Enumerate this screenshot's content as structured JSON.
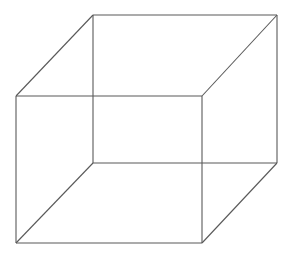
{
  "figure": {
    "background_color": "#ffffff",
    "stroke_color": "#595959",
    "stroke_width": 1.1,
    "canvas": {
      "width": 304,
      "height": 263
    }
  },
  "geometry": {
    "vertices": {
      "front_top_left": {
        "label": "front-top-left",
        "x": 16,
        "y": 96
      },
      "front_top_right": {
        "label": "front-top-right",
        "x": 202,
        "y": 96
      },
      "front_bottom_right": {
        "label": "front-bottom-right",
        "x": 202,
        "y": 243
      },
      "front_bottom_left": {
        "label": "front-bottom-left",
        "x": 16,
        "y": 243
      },
      "back_top_left": {
        "label": "back-top-left",
        "x": 93,
        "y": 15
      },
      "back_top_right": {
        "label": "back-top-right",
        "x": 277,
        "y": 15
      },
      "back_bottom_right": {
        "label": "back-bottom-right",
        "x": 277,
        "y": 163
      },
      "back_bottom_left": {
        "label": "back-bottom-left",
        "x": 93,
        "y": 163
      }
    },
    "edges": [
      {
        "name": "front-top-edge",
        "x1": 16,
        "y1": 96,
        "x2": 202,
        "y2": 96
      },
      {
        "name": "front-right-edge",
        "x1": 202,
        "y1": 96,
        "x2": 202,
        "y2": 243
      },
      {
        "name": "front-bottom-edge",
        "x1": 202,
        "y1": 243,
        "x2": 16,
        "y2": 243
      },
      {
        "name": "front-left-edge",
        "x1": 16,
        "y1": 243,
        "x2": 16,
        "y2": 96
      },
      {
        "name": "back-top-edge",
        "x1": 93,
        "y1": 15,
        "x2": 277,
        "y2": 15
      },
      {
        "name": "back-right-edge",
        "x1": 277,
        "y1": 15,
        "x2": 277,
        "y2": 163
      },
      {
        "name": "back-bottom-edge",
        "x1": 277,
        "y1": 163,
        "x2": 93,
        "y2": 163
      },
      {
        "name": "back-left-edge",
        "x1": 93,
        "y1": 163,
        "x2": 93,
        "y2": 15
      },
      {
        "name": "connector-top-left",
        "x1": 16,
        "y1": 96,
        "x2": 93,
        "y2": 15
      },
      {
        "name": "connector-top-right",
        "x1": 202,
        "y1": 96,
        "x2": 277,
        "y2": 15
      },
      {
        "name": "connector-bottom-right",
        "x1": 202,
        "y1": 243,
        "x2": 277,
        "y2": 163
      },
      {
        "name": "connector-bottom-left",
        "x1": 16,
        "y1": 243,
        "x2": 93,
        "y2": 163
      }
    ]
  }
}
